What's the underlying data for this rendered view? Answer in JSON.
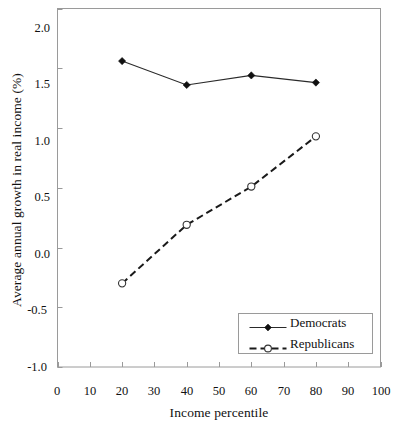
{
  "chart_data": {
    "type": "line",
    "title": "",
    "xlabel": "Income percentile",
    "ylabel": "Average annual growth in real income (%)",
    "xlim": [
      0,
      100
    ],
    "ylim": [
      -1.0,
      2.0
    ],
    "xticks": [
      "0",
      "10",
      "20",
      "30",
      "40",
      "50",
      "60",
      "70",
      "80",
      "90",
      "100"
    ],
    "yticks": [
      "2.0",
      "1.5",
      "1.0",
      "0.5",
      "0.0",
      "-0.5",
      "-1.0"
    ],
    "xtick_values": [
      0,
      10,
      20,
      30,
      40,
      50,
      60,
      70,
      80,
      90,
      100
    ],
    "ytick_values": [
      2.0,
      1.5,
      1.0,
      0.5,
      0.0,
      -0.5,
      -1.0
    ],
    "grid": false,
    "legend_position": "lower right",
    "x": [
      20,
      40,
      60,
      80
    ],
    "series": [
      {
        "name": "Democrats",
        "values": [
          1.56,
          1.36,
          1.44,
          1.38
        ],
        "line_style": "solid",
        "marker": "filled-diamond",
        "color": "#111111"
      },
      {
        "name": "Republicans",
        "values": [
          -0.3,
          0.19,
          0.51,
          0.93
        ],
        "line_style": "dashed",
        "marker": "open-circle",
        "color": "#111111"
      }
    ]
  },
  "legend": {
    "entries": [
      {
        "label": "Democrats"
      },
      {
        "label": "Republicans"
      }
    ]
  }
}
